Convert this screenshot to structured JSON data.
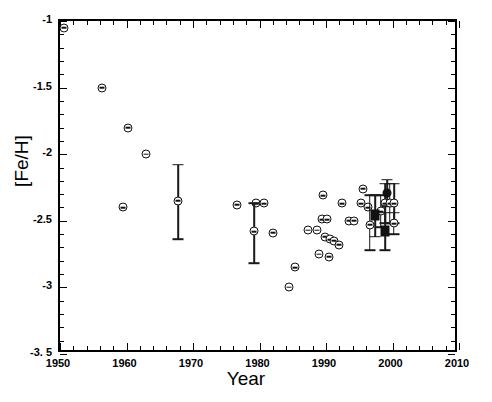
{
  "chart_data": {
    "type": "scatter",
    "title": "",
    "xlabel": "Year",
    "ylabel": "[Fe/H]",
    "xlim": [
      1950,
      2010
    ],
    "ylim": [
      -3.5,
      -1.0
    ],
    "xticks": [
      1950,
      1960,
      1970,
      1980,
      1990,
      2000,
      2010
    ],
    "xtick_labels": [
      "1950",
      "1960",
      "1970",
      "1980",
      "1990",
      "2000",
      "2010"
    ],
    "yticks": [
      -1.0,
      -1.5,
      -2.0,
      -2.5,
      -3.0,
      -3.5
    ],
    "ytick_labels": [
      "-1",
      "-1.5",
      "-2",
      "-2.5",
      "-3",
      "-3. 5"
    ],
    "x_minor_interval": 2,
    "y_minor_interval": 0.1,
    "grid": false,
    "legend": null,
    "series": [
      {
        "name": "Published [Fe/H] determinations",
        "marker": "open-circle",
        "points": [
          {
            "x": 1950.6,
            "y": -1.05,
            "marker": "open-circle"
          },
          {
            "x": 1956.3,
            "y": -1.5,
            "marker": "open-circle"
          },
          {
            "x": 1960.2,
            "y": -1.8,
            "marker": "open-circle"
          },
          {
            "x": 1963.0,
            "y": -2.0,
            "marker": "open-circle"
          },
          {
            "x": 1959.5,
            "y": -2.4,
            "marker": "open-circle"
          },
          {
            "x": 1967.8,
            "y": -2.35,
            "marker": "open-circle",
            "yerr_low": -2.64,
            "yerr_high": -2.08
          },
          {
            "x": 1976.6,
            "y": -2.38,
            "marker": "open-circle"
          },
          {
            "x": 1979.4,
            "y": -2.37,
            "marker": "open-circle"
          },
          {
            "x": 1980.7,
            "y": -2.37,
            "marker": "open-circle"
          },
          {
            "x": 1979.2,
            "y": -2.58,
            "marker": "open-circle",
            "yerr_low": -2.82,
            "yerr_high": -2.37
          },
          {
            "x": 1982.0,
            "y": -2.59,
            "marker": "open-circle"
          },
          {
            "x": 1985.3,
            "y": -2.85,
            "marker": "open-circle"
          },
          {
            "x": 1984.5,
            "y": -3.0,
            "marker": "open-circle"
          },
          {
            "x": 1987.3,
            "y": -2.57,
            "marker": "open-circle"
          },
          {
            "x": 1988.6,
            "y": -2.57,
            "marker": "open-circle"
          },
          {
            "x": 1989.5,
            "y": -2.31,
            "marker": "open-circle"
          },
          {
            "x": 1989.4,
            "y": -2.49,
            "marker": "open-circle"
          },
          {
            "x": 1990.2,
            "y": -2.49,
            "marker": "open-circle"
          },
          {
            "x": 1989.9,
            "y": -2.62,
            "marker": "open-circle"
          },
          {
            "x": 1990.6,
            "y": -2.64,
            "marker": "open-circle"
          },
          {
            "x": 1991.2,
            "y": -2.65,
            "marker": "open-circle"
          },
          {
            "x": 1990.4,
            "y": -2.77,
            "marker": "open-circle"
          },
          {
            "x": 1988.9,
            "y": -2.75,
            "marker": "open-circle"
          },
          {
            "x": 1992.4,
            "y": -2.37,
            "marker": "open-circle"
          },
          {
            "x": 1992.0,
            "y": -2.68,
            "marker": "open-circle"
          },
          {
            "x": 1993.4,
            "y": -2.5,
            "marker": "open-circle"
          },
          {
            "x": 1994.2,
            "y": -2.5,
            "marker": "open-circle"
          },
          {
            "x": 1995.6,
            "y": -2.26,
            "marker": "open-circle"
          },
          {
            "x": 1995.3,
            "y": -2.37,
            "marker": "open-circle"
          },
          {
            "x": 1996.3,
            "y": -2.4,
            "marker": "open-circle"
          },
          {
            "x": 1996.6,
            "y": -2.53,
            "marker": "open-circle",
            "yerr_low": -2.72,
            "yerr_high": -2.31
          },
          {
            "x": 1998.2,
            "y": -2.43,
            "marker": "open-circle",
            "yerr_low": -2.55,
            "yerr_high": -2.31
          },
          {
            "x": 1998.9,
            "y": -2.37,
            "marker": "open-circle",
            "yerr_low": -2.52,
            "yerr_high": -2.22
          },
          {
            "x": 1999.2,
            "y": -2.29,
            "marker": "filled-circle",
            "yerr_low": -2.39,
            "yerr_high": -2.19
          },
          {
            "x": 1999.6,
            "y": -2.37,
            "marker": "open-circle",
            "yerr_low": -2.52,
            "yerr_high": -2.22
          },
          {
            "x": 2000.3,
            "y": -2.37,
            "marker": "open-circle",
            "yerr_low": -2.52,
            "yerr_high": -2.22
          },
          {
            "x": 2000.2,
            "y": -2.52,
            "marker": "open-circle",
            "yerr_low": -2.6,
            "yerr_high": -2.44
          },
          {
            "x": 1997.4,
            "y": -2.46,
            "marker": "filled-square",
            "yerr_low": -2.62,
            "yerr_high": -2.31
          },
          {
            "x": 1998.9,
            "y": -2.58,
            "marker": "filled-square",
            "yerr_low": -2.72,
            "yerr_high": -2.44
          }
        ]
      }
    ]
  }
}
